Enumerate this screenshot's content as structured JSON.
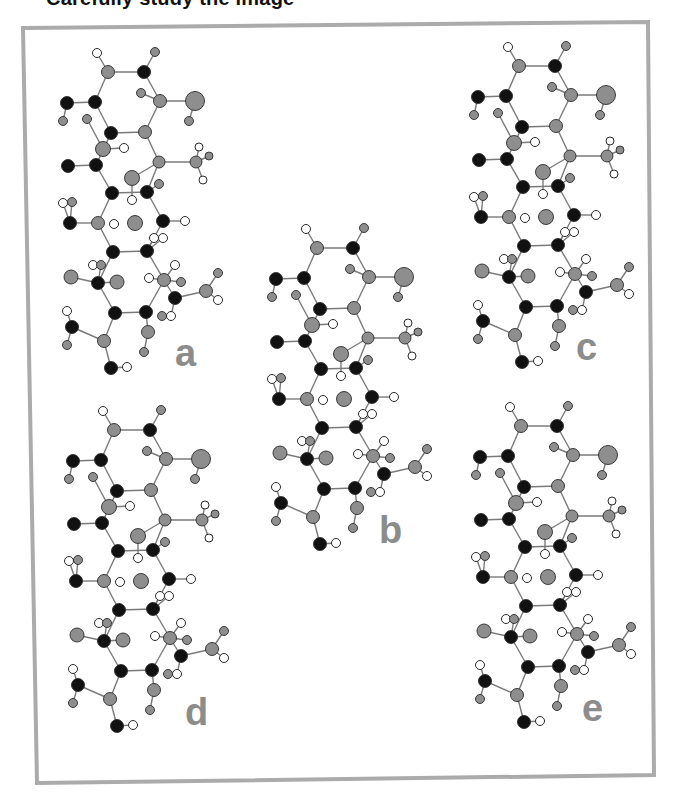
{
  "header": {
    "title": "Carefully study the image"
  },
  "colors": {
    "frame": "#ababab",
    "bond": "#7a7a7a",
    "atom_stroke": "#2a2a2a",
    "black_atom": "#111111",
    "gray_atom": "#8e8e8e",
    "white_atom": "#ffffff",
    "label": "#8c8c8c"
  },
  "frame": {
    "corners": [
      [
        23,
        28
      ],
      [
        648,
        22
      ],
      [
        654,
        775
      ],
      [
        37,
        783
      ]
    ],
    "stroke_width": 4
  },
  "molecule": {
    "atoms": [
      [
        97,
        53,
        "w",
        4.5
      ],
      [
        108,
        72,
        "g",
        6.5
      ],
      [
        144,
        72,
        "k",
        6.5
      ],
      [
        155,
        52,
        "g",
        4.5
      ],
      [
        67,
        103,
        "k",
        6.5
      ],
      [
        95,
        102,
        "k",
        6.5
      ],
      [
        141,
        93,
        "g",
        4.5
      ],
      [
        160,
        101,
        "g",
        6.5
      ],
      [
        195,
        101,
        "g",
        9.5
      ],
      [
        189,
        121,
        "g",
        4.5
      ],
      [
        63,
        121,
        "g",
        4.5
      ],
      [
        87,
        119,
        "g",
        4.5
      ],
      [
        111,
        133,
        "k",
        6.5
      ],
      [
        145,
        132,
        "g",
        6.5
      ],
      [
        103,
        149,
        "g",
        7.5
      ],
      [
        124,
        148,
        "w",
        4.5
      ],
      [
        68,
        166,
        "k",
        6.5
      ],
      [
        96,
        165,
        "k",
        6.5
      ],
      [
        159,
        162,
        "g",
        6
      ],
      [
        196,
        162,
        "g",
        6
      ],
      [
        199,
        147,
        "w",
        4
      ],
      [
        209,
        156,
        "g",
        4
      ],
      [
        203,
        180,
        "w",
        4
      ],
      [
        132,
        178,
        "g",
        7.5
      ],
      [
        159,
        184,
        "g",
        4.5
      ],
      [
        112,
        193,
        "k",
        6.5
      ],
      [
        147,
        192,
        "k",
        6.5
      ],
      [
        132,
        200,
        "w",
        4.5
      ],
      [
        63,
        203,
        "w",
        4.5
      ],
      [
        72,
        202,
        "g",
        4.5
      ],
      [
        70,
        223,
        "k",
        6.5
      ],
      [
        98,
        223,
        "g",
        6.5
      ],
      [
        114,
        224,
        "w",
        4.5
      ],
      [
        135,
        223,
        "g",
        7.5
      ],
      [
        163,
        221,
        "k",
        6.5
      ],
      [
        185,
        221,
        "w",
        4.5
      ],
      [
        154,
        238,
        "w",
        4.5
      ],
      [
        163,
        238,
        "w",
        4.5
      ],
      [
        113,
        252,
        "k",
        6.5
      ],
      [
        147,
        251,
        "k",
        6.5
      ],
      [
        93,
        265,
        "w",
        4.5
      ],
      [
        101,
        265,
        "g",
        4.5
      ],
      [
        175,
        265,
        "w",
        4.5
      ],
      [
        71,
        277,
        "g",
        7
      ],
      [
        98,
        283,
        "k",
        6.5
      ],
      [
        117,
        282,
        "g",
        7
      ],
      [
        149,
        278,
        "w",
        4.5
      ],
      [
        164,
        280,
        "g",
        6.5
      ],
      [
        181,
        282,
        "g",
        4.5
      ],
      [
        218,
        273,
        "g",
        4.5
      ],
      [
        206,
        291,
        "g",
        6.5
      ],
      [
        218,
        300,
        "w",
        4.5
      ],
      [
        175,
        298,
        "k",
        6.5
      ],
      [
        115,
        313,
        "k",
        6.5
      ],
      [
        146,
        312,
        "k",
        6.5
      ],
      [
        67,
        311,
        "w",
        4.5
      ],
      [
        162,
        316,
        "g",
        4.5
      ],
      [
        171,
        316,
        "w",
        4.5
      ],
      [
        72,
        327,
        "k",
        6.5
      ],
      [
        104,
        341,
        "g",
        6.5
      ],
      [
        148,
        332,
        "g",
        6.5
      ],
      [
        67,
        345,
        "g",
        4.5
      ],
      [
        144,
        352,
        "g",
        4.5
      ],
      [
        111,
        368,
        "k",
        6.5
      ],
      [
        127,
        367,
        "w",
        4.5
      ]
    ],
    "bonds": [
      [
        1,
        2
      ],
      [
        2,
        3
      ],
      [
        3,
        4
      ],
      [
        2,
        6
      ],
      [
        3,
        8
      ],
      [
        5,
        6
      ],
      [
        5,
        11
      ],
      [
        6,
        13
      ],
      [
        7,
        8
      ],
      [
        8,
        9
      ],
      [
        9,
        10
      ],
      [
        8,
        14
      ],
      [
        13,
        14
      ],
      [
        12,
        15
      ],
      [
        15,
        16
      ],
      [
        13,
        18
      ],
      [
        17,
        18
      ],
      [
        14,
        19
      ],
      [
        19,
        27
      ],
      [
        27,
        26
      ],
      [
        26,
        18
      ],
      [
        19,
        20
      ],
      [
        20,
        21
      ],
      [
        20,
        22
      ],
      [
        20,
        23
      ],
      [
        24,
        19
      ],
      [
        24,
        28
      ],
      [
        25,
        27
      ],
      [
        27,
        35
      ],
      [
        35,
        40
      ],
      [
        40,
        39
      ],
      [
        39,
        32
      ],
      [
        32,
        26
      ],
      [
        29,
        31
      ],
      [
        30,
        31
      ],
      [
        31,
        32
      ],
      [
        35,
        36
      ],
      [
        37,
        40
      ],
      [
        38,
        40
      ],
      [
        40,
        48
      ],
      [
        48,
        55
      ],
      [
        55,
        54
      ],
      [
        54,
        45
      ],
      [
        45,
        39
      ],
      [
        44,
        45
      ],
      [
        45,
        46
      ],
      [
        42,
        45
      ],
      [
        41,
        42
      ],
      [
        43,
        48
      ],
      [
        47,
        48
      ],
      [
        48,
        49
      ],
      [
        48,
        53
      ],
      [
        53,
        51
      ],
      [
        51,
        50
      ],
      [
        51,
        52
      ],
      [
        53,
        58
      ],
      [
        57,
        58
      ],
      [
        54,
        60
      ],
      [
        55,
        61
      ],
      [
        61,
        63
      ],
      [
        59,
        60
      ],
      [
        56,
        59
      ],
      [
        59,
        62
      ],
      [
        60,
        64
      ],
      [
        64,
        65
      ]
    ]
  },
  "structures": [
    {
      "id": "a",
      "label": "a",
      "offset": [
        0,
        0
      ],
      "label_pos": [
        175,
        366
      ]
    },
    {
      "id": "b",
      "label": "b",
      "offset": [
        209,
        176
      ],
      "label_pos": [
        379,
        543
      ]
    },
    {
      "id": "c",
      "label": "c",
      "offset": [
        411,
        -6
      ],
      "label_pos": [
        576,
        360
      ]
    },
    {
      "id": "d",
      "label": "d",
      "offset": [
        6,
        358
      ],
      "label_pos": [
        185,
        725
      ]
    },
    {
      "id": "e",
      "label": "e",
      "offset": [
        413,
        354
      ],
      "label_pos": [
        582,
        721
      ]
    }
  ]
}
